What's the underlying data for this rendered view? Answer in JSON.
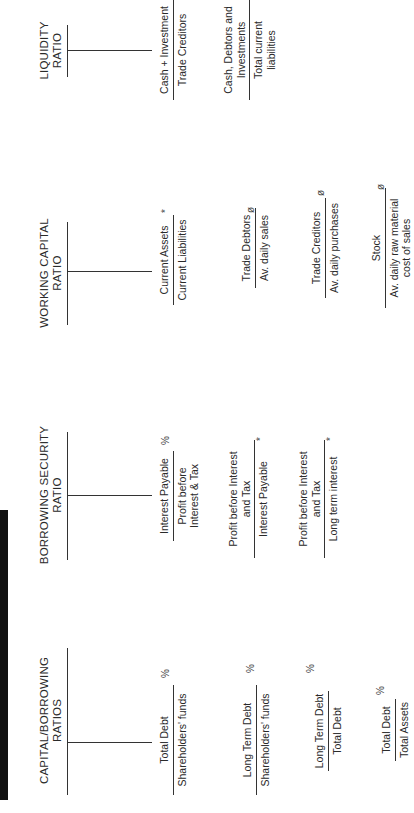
{
  "sections": [
    {
      "title_line1": "CAPITAL/BORROWING",
      "title_line2": "RATIOS",
      "formulas": [
        {
          "numerator": "Total Debt",
          "denominator": "Shareholders' funds",
          "unit": "%"
        },
        {
          "numerator": "Long Term Debt",
          "denominator": "Shareholders' funds",
          "unit": "%"
        },
        {
          "numerator": "Long Term Debt",
          "denominator": "Total Debt",
          "unit": "%"
        },
        {
          "numerator": "Total Debt",
          "denominator": "Total Assets",
          "unit": "%"
        }
      ]
    },
    {
      "title_line1": "BORROWING SECURITY",
      "title_line2": "RATIO",
      "formulas": [
        {
          "numerator": "Interest Payable",
          "denominator": "Profit before Interest & Tax",
          "unit": "%"
        },
        {
          "numerator": "Profit before Interest and Tax",
          "denominator": "Interest Payable",
          "unit": "*"
        },
        {
          "numerator": "Profit before Interest and Tax",
          "denominator": "Long term interest",
          "unit": "*"
        }
      ]
    },
    {
      "title_line1": "WORKING CAPITAL",
      "title_line2": "RATIO",
      "formulas": [
        {
          "numerator": "Current Assets",
          "denominator": "Current Liabilities",
          "unit": "*"
        },
        {
          "numerator": "Trade Debtors",
          "denominator": "Av. daily sales",
          "unit": "ø"
        },
        {
          "numerator": "Trade Creditors",
          "denominator": "Av. daily purchases",
          "unit": "ø"
        },
        {
          "numerator": "Stock",
          "denominator": "Av. daily raw material cost of sales",
          "unit": "ø"
        }
      ]
    },
    {
      "title_line1": "LIQUIDITY",
      "title_line2": "RATIO",
      "formulas": [
        {
          "numerator": "Cash + Investment",
          "denominator": "Trade Creditors",
          "unit": ""
        },
        {
          "numerator": "Cash, Debtors and Investments",
          "denominator": "Total current liabilities",
          "unit": ""
        }
      ]
    }
  ]
}
